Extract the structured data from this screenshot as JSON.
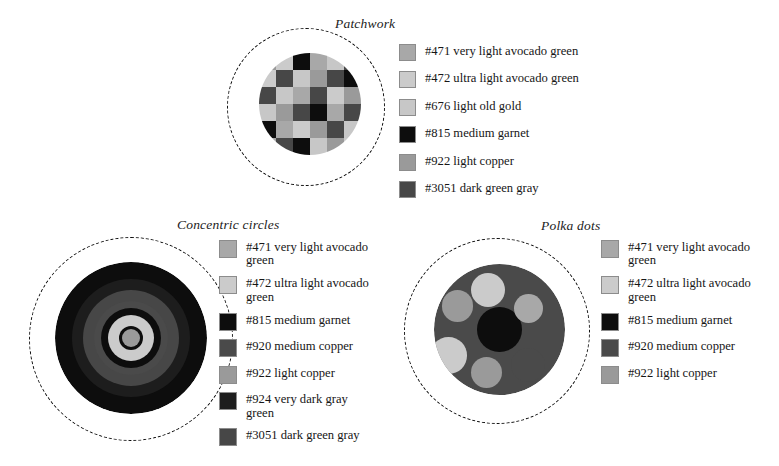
{
  "page": {
    "background": "#ffffff",
    "width": 779,
    "height": 466
  },
  "palette": {
    "471": "#a8a8a8",
    "472": "#cbcbcb",
    "676": "#c7c7c7",
    "815": "#0d0d0d",
    "920": "#4a4a4a",
    "922": "#9a9a9a",
    "924": "#1d1d1d",
    "3051": "#474747"
  },
  "panels": [
    {
      "id": "patchwork",
      "title": "Patchwork",
      "legend": [
        {
          "code": "#471",
          "label": "#471 very light avocado green",
          "color": "#a8a8a8"
        },
        {
          "code": "#472",
          "label": "#472 ultra light avocado green",
          "color": "#cbcbcb"
        },
        {
          "code": "#676",
          "label": "#676 light old gold",
          "color": "#c7c7c7"
        },
        {
          "code": "#815",
          "label": "#815 medium garnet",
          "color": "#0d0d0d"
        },
        {
          "code": "#922",
          "label": "#922 light copper",
          "color": "#9a9a9a"
        },
        {
          "code": "#3051",
          "label": "#3051 dark green gray",
          "color": "#474747"
        }
      ],
      "grid": [
        [
          "#9a9a9a",
          "#cbcbcb",
          "#0d0d0d",
          "#a8a8a8",
          "#c7c7c7",
          "#474747"
        ],
        [
          "#cbcbcb",
          "#474747",
          "#c7c7c7",
          "#9a9a9a",
          "#474747",
          "#0d0d0d"
        ],
        [
          "#474747",
          "#c7c7c7",
          "#a8a8a8",
          "#474747",
          "#cbcbcb",
          "#9a9a9a"
        ],
        [
          "#c7c7c7",
          "#9a9a9a",
          "#474747",
          "#0d0d0d",
          "#a8a8a8",
          "#474747"
        ],
        [
          "#0d0d0d",
          "#a8a8a8",
          "#cbcbcb",
          "#9a9a9a",
          "#474747",
          "#c7c7c7"
        ],
        [
          "#a8a8a8",
          "#474747",
          "#0d0d0d",
          "#c7c7c7",
          "#9a9a9a",
          "#cbcbcb"
        ]
      ]
    },
    {
      "id": "concentric",
      "title": "Concentric circles",
      "legend": [
        {
          "code": "#471",
          "label": "#471 very light avocado green",
          "color": "#a8a8a8"
        },
        {
          "code": "#472",
          "label": "#472 ultra light avocado green",
          "color": "#cbcbcb"
        },
        {
          "code": "#815",
          "label": "#815 medium garnet",
          "color": "#0d0d0d"
        },
        {
          "code": "#920",
          "label": "#920 medium copper",
          "color": "#4a4a4a"
        },
        {
          "code": "#922",
          "label": "#922 light copper",
          "color": "#9a9a9a"
        },
        {
          "code": "#924",
          "label": "#924 very dark gray green",
          "color": "#1d1d1d"
        },
        {
          "code": "#3051",
          "label": "#3051 dark green gray",
          "color": "#474747"
        }
      ],
      "rings": [
        {
          "diameter": 152,
          "color": "#0d0d0d"
        },
        {
          "diameter": 118,
          "color": "#1d1d1d"
        },
        {
          "diameter": 96,
          "color": "#474747"
        },
        {
          "diameter": 74,
          "color": "#4a4a4a"
        },
        {
          "diameter": 60,
          "color": "#0d0d0d"
        },
        {
          "diameter": 46,
          "color": "#cbcbcb"
        },
        {
          "diameter": 24,
          "color": "#0d0d0d"
        },
        {
          "diameter": 18,
          "color": "#9a9a9a"
        }
      ]
    },
    {
      "id": "polka",
      "title": "Polka dots",
      "legend": [
        {
          "code": "#471",
          "label": "#471 very light avocado green",
          "color": "#a8a8a8"
        },
        {
          "code": "#472",
          "label": "#472 ultra light avocado green",
          "color": "#cbcbcb"
        },
        {
          "code": "#815",
          "label": "#815 medium garnet",
          "color": "#0d0d0d"
        },
        {
          "code": "#920",
          "label": "#920 medium copper",
          "color": "#4a4a4a"
        },
        {
          "code": "#922",
          "label": "#922 light copper",
          "color": "#9a9a9a"
        }
      ],
      "base_color": "#4a4a4a",
      "dots": [
        {
          "cx": 50,
          "cy": 50,
          "r": 17,
          "color": "#0d0d0d"
        },
        {
          "cx": 41,
          "cy": 20,
          "r": 13,
          "color": "#cbcbcb"
        },
        {
          "cx": 18,
          "cy": 32,
          "r": 12,
          "color": "#9a9a9a"
        },
        {
          "cx": 72,
          "cy": 34,
          "r": 11,
          "color": "#a8a8a8"
        },
        {
          "cx": 11,
          "cy": 70,
          "r": 14,
          "color": "#cbcbcb"
        },
        {
          "cx": 40,
          "cy": 83,
          "r": 12,
          "color": "#9a9a9a"
        },
        {
          "cx": 72,
          "cy": 77,
          "r": 13,
          "color": "#4a4a4a"
        }
      ]
    }
  ]
}
